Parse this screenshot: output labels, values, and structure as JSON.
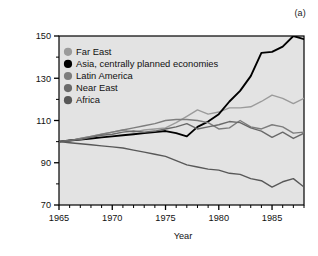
{
  "figure": {
    "panel_label": "(a)",
    "background_color": "#ffffff",
    "plot_background_color": "#e3e3e3",
    "axis_color": "#000000"
  },
  "chart_data": {
    "type": "line",
    "title": "",
    "xlabel": "Year",
    "ylabel": "Per capita food production (arbitrary numbers)",
    "xlim": [
      1965,
      1988
    ],
    "ylim": [
      70,
      150
    ],
    "xticks": [
      1965,
      1970,
      1975,
      1980,
      1985
    ],
    "xtick_labels": [
      "1965",
      "1970",
      "1975",
      "1980",
      "1985"
    ],
    "xminor_step": 1,
    "yticks": [
      70,
      90,
      110,
      130,
      150
    ],
    "ytick_labels": [
      "70",
      "90",
      "110",
      "130",
      "150"
    ],
    "grid": false,
    "legend_position": "upper-left-inside",
    "x": [
      1965,
      1966,
      1967,
      1968,
      1969,
      1970,
      1971,
      1972,
      1973,
      1974,
      1975,
      1976,
      1977,
      1978,
      1979,
      1980,
      1981,
      1982,
      1983,
      1984,
      1985,
      1986,
      1987,
      1988
    ],
    "series": [
      {
        "name": "Far East",
        "color": "#9b9b9b",
        "marker_color": "#9b9b9b",
        "values": [
          100,
          100.5,
          101.5,
          102.5,
          103.5,
          104.5,
          105.5,
          104.5,
          105.5,
          106,
          106.5,
          109,
          112,
          115,
          113,
          114,
          116,
          116,
          116.5,
          119,
          122,
          120.5,
          118,
          120.5
        ]
      },
      {
        "name": "Asia, centrally planned economies",
        "color": "#000000",
        "marker_color": "#000000",
        "values": [
          100,
          100.5,
          101,
          101.5,
          102,
          102.5,
          103,
          103.5,
          104,
          104.5,
          105,
          104,
          102.5,
          107,
          109.5,
          113,
          119,
          124,
          131,
          142,
          142.5,
          145,
          150,
          148.5
        ]
      },
      {
        "name": "Latin America",
        "color": "#7d7d7d",
        "marker_color": "#7d7d7d",
        "values": [
          100,
          100.5,
          101.5,
          102.5,
          103.5,
          104.5,
          105.5,
          106.5,
          107.5,
          108.5,
          110,
          110.5,
          110.5,
          110,
          109,
          106,
          106.5,
          110,
          107,
          106,
          108,
          107,
          104,
          104.5
        ]
      },
      {
        "name": "Near East",
        "color": "#6a6a6a",
        "marker_color": "#6a6a6a",
        "values": [
          100,
          100.5,
          101,
          102,
          103,
          103.5,
          104.5,
          105,
          104.5,
          105,
          106,
          107,
          108.5,
          106,
          107,
          108,
          109.5,
          109,
          106.5,
          105,
          102,
          104.5,
          101.5,
          104
        ]
      },
      {
        "name": "Africa",
        "color": "#585858",
        "marker_color": "#585858",
        "values": [
          100,
          99.5,
          99,
          98.5,
          98,
          97.5,
          97,
          96,
          95,
          94,
          93,
          91,
          89,
          88,
          87,
          86.5,
          85,
          84.5,
          82.5,
          81.5,
          78.5,
          81,
          82.5,
          78.5
        ]
      }
    ]
  }
}
